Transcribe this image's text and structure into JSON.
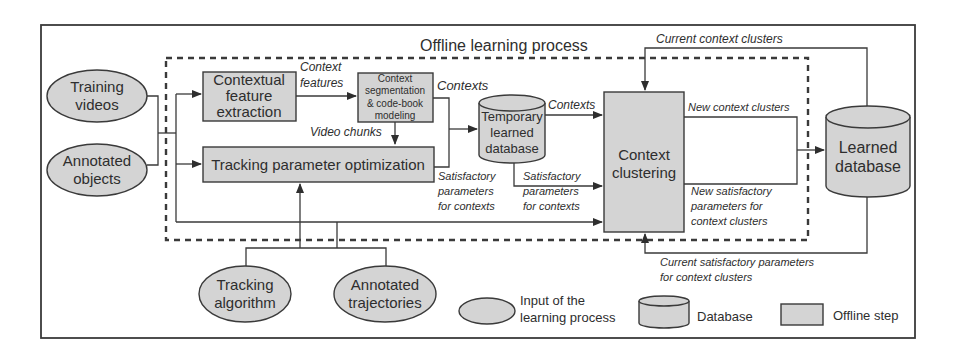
{
  "diagram": {
    "title": "Offline learning process",
    "inputs": [
      {
        "id": "training-videos",
        "lines": [
          "Training",
          "videos"
        ]
      },
      {
        "id": "annotated-objects",
        "lines": [
          "Annotated",
          "objects"
        ]
      },
      {
        "id": "tracking-algorithm",
        "lines": [
          "Tracking",
          "algorithm"
        ]
      },
      {
        "id": "annotated-trajectories",
        "lines": [
          "Annotated",
          "trajectories"
        ]
      }
    ],
    "steps": [
      {
        "id": "contextual-feature-extraction",
        "lines": [
          "Contextual",
          "feature",
          "extraction"
        ]
      },
      {
        "id": "context-segmentation",
        "lines": [
          "Context",
          "segmentation",
          "& code-book",
          "modeling"
        ]
      },
      {
        "id": "tracking-parameter-optimization",
        "lines": [
          "Tracking parameter optimization"
        ]
      },
      {
        "id": "context-clustering",
        "lines": [
          "Context",
          "clustering"
        ]
      }
    ],
    "databases": [
      {
        "id": "temporary-learned-database",
        "lines": [
          "Temporary",
          "learned",
          "database"
        ]
      },
      {
        "id": "learned-database",
        "lines": [
          "Learned",
          "database"
        ]
      }
    ],
    "edge_labels": {
      "context_features": [
        "Context",
        "features"
      ],
      "contexts_1": "Contexts",
      "contexts_2": "Contexts",
      "video_chunks": "Video chunks",
      "satisfactory_1": [
        "Satisfactory",
        "parameters",
        "for contexts"
      ],
      "satisfactory_2": [
        "Satisfactory",
        "parameters",
        "for contexts"
      ],
      "current_context_clusters": "Current context clusters",
      "new_context_clusters": "New context clusters",
      "new_satisfactory": [
        "New satisfactory",
        "parameters for",
        "context clusters"
      ],
      "current_satisfactory": [
        "Current satisfactory parameters",
        "for context clusters"
      ]
    },
    "legend": {
      "input_label": [
        "Input of the",
        "learning process"
      ],
      "database_label": "Database",
      "step_label": "Offline step"
    }
  }
}
